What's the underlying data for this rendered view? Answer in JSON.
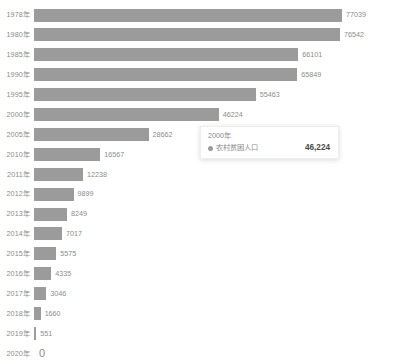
{
  "chart_data": {
    "type": "bar",
    "orientation": "horizontal",
    "title": "",
    "xlabel": "",
    "ylabel": "",
    "grid": false,
    "legend": "none",
    "series_name": "农村贫困人口",
    "xlim": [
      0,
      77039
    ],
    "categories": [
      "1978年",
      "1980年",
      "1985年",
      "1990年",
      "1995年",
      "2000年",
      "2005年",
      "2010年",
      "2011年",
      "2012年",
      "2013年",
      "2014年",
      "2015年",
      "2016年",
      "2017年",
      "2018年",
      "2019年",
      "2020年"
    ],
    "values": [
      77039,
      76542,
      66101,
      65849,
      55463,
      46224,
      28662,
      16567,
      12238,
      9899,
      8249,
      7017,
      5575,
      4335,
      3046,
      1660,
      551,
      0
    ],
    "value_labels": [
      "77039",
      "76542",
      "66101",
      "65849",
      "55463",
      "46224",
      "28662",
      "16567",
      "12238",
      "9899",
      "8249",
      "7017",
      "5575",
      "4335",
      "3046",
      "1660",
      "551",
      "0"
    ],
    "bar_color": "#9b9b9b",
    "label_color": "#8c8c8c"
  },
  "tooltip": {
    "title": "2000年",
    "series_label": "农村贫困人口",
    "value": "46,224",
    "marker_color": "#9b9b9b"
  }
}
